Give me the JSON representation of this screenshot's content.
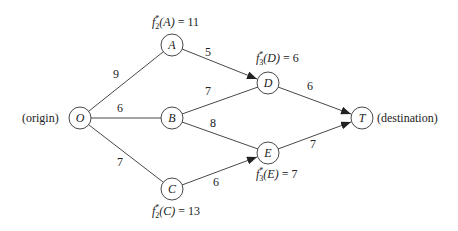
{
  "diagram": {
    "nodes": [
      {
        "id": "O",
        "label": "O",
        "x": 80,
        "y": 118
      },
      {
        "id": "A",
        "label": "A",
        "x": 172,
        "y": 45
      },
      {
        "id": "B",
        "label": "B",
        "x": 172,
        "y": 118
      },
      {
        "id": "C",
        "label": "C",
        "x": 172,
        "y": 189
      },
      {
        "id": "D",
        "label": "D",
        "x": 268,
        "y": 83
      },
      {
        "id": "E",
        "label": "E",
        "x": 268,
        "y": 153
      },
      {
        "id": "T",
        "label": "T",
        "x": 362,
        "y": 118
      }
    ],
    "edges": [
      {
        "from": "O",
        "to": "A",
        "weight": "9",
        "arrow": false
      },
      {
        "from": "O",
        "to": "B",
        "weight": "6",
        "arrow": false
      },
      {
        "from": "O",
        "to": "C",
        "weight": "7",
        "arrow": false
      },
      {
        "from": "A",
        "to": "D",
        "weight": "5",
        "arrow": true
      },
      {
        "from": "B",
        "to": "D",
        "weight": "7",
        "arrow": false
      },
      {
        "from": "B",
        "to": "E",
        "weight": "8",
        "arrow": false
      },
      {
        "from": "C",
        "to": "E",
        "weight": "6",
        "arrow": true
      },
      {
        "from": "D",
        "to": "T",
        "weight": "6",
        "arrow": true
      },
      {
        "from": "E",
        "to": "T",
        "weight": "7",
        "arrow": true
      }
    ],
    "side_labels": {
      "origin": "(origin)",
      "destination": "(destination)"
    },
    "values": {
      "A": {
        "f": "f",
        "star": "*",
        "stage": "2",
        "arg": "(A)",
        "eq": " = 11"
      },
      "C": {
        "f": "f",
        "star": "*",
        "stage": "2",
        "arg": "(C)",
        "eq": " = 13"
      },
      "D": {
        "f": "f",
        "star": "*",
        "stage": "3",
        "arg": "(D)",
        "eq": " = 6"
      },
      "E": {
        "f": "f",
        "star": "*",
        "stage": "3",
        "arg": "(E)",
        "eq": " = 7"
      }
    }
  }
}
